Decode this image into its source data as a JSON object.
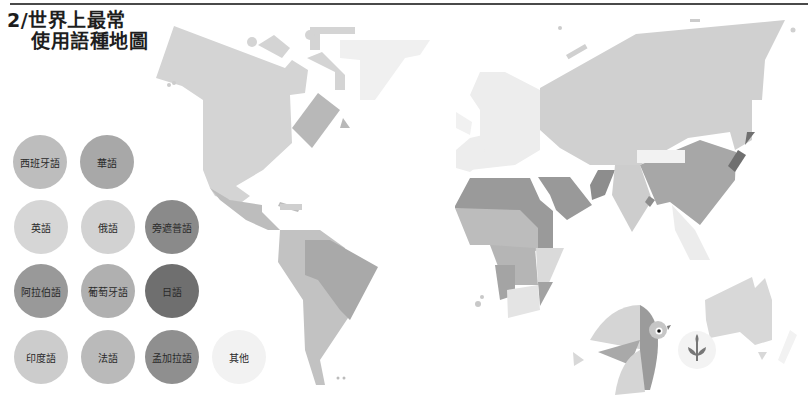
{
  "title": {
    "line1": "2/世界上最常",
    "line2": "使用語種地圖"
  },
  "legend": [
    {
      "label": "西班牙語",
      "color": "#bdbdbd"
    },
    {
      "label": "華語",
      "color": "#a8a8a8"
    },
    {
      "label": "英語",
      "color": "#d6d6d6"
    },
    {
      "label": "俄語",
      "color": "#d2d2d2"
    },
    {
      "label": "旁遮普語",
      "color": "#8a8a8a"
    },
    {
      "label": "阿拉伯語",
      "color": "#999999"
    },
    {
      "label": "葡萄牙語",
      "color": "#b0b0b0"
    },
    {
      "label": "日語",
      "color": "#6f6f6f"
    },
    {
      "label": "印度語",
      "color": "#cccccc"
    },
    {
      "label": "法語",
      "color": "#bababa"
    },
    {
      "label": "孟加拉語",
      "color": "#8f8f8f"
    },
    {
      "label": "其他",
      "color": "#f2f2f2"
    }
  ],
  "regions": [
    {
      "name": "north-america",
      "language": "英語",
      "color": "#d4d4d4"
    },
    {
      "name": "greenland",
      "language": "其他",
      "color": "#f0f0f0"
    },
    {
      "name": "quebec",
      "language": "法語",
      "color": "#b8b8b8"
    },
    {
      "name": "mexico-central-america",
      "language": "西班牙語",
      "color": "#bdbdbd"
    },
    {
      "name": "brazil",
      "language": "葡萄牙語",
      "color": "#a9a9a9"
    },
    {
      "name": "south-america-spanish",
      "language": "西班牙語",
      "color": "#c2c2c2"
    },
    {
      "name": "europe",
      "language": "其他",
      "color": "#ededed"
    },
    {
      "name": "russia",
      "language": "俄語",
      "color": "#d0d0d0"
    },
    {
      "name": "north-africa",
      "language": "阿拉伯語",
      "color": "#9a9a9a"
    },
    {
      "name": "middle-east",
      "language": "阿拉伯語",
      "color": "#999999"
    },
    {
      "name": "west-africa",
      "language": "法語",
      "color": "#bcbcbc"
    },
    {
      "name": "central-africa",
      "language": "法語",
      "color": "#b5b5b5"
    },
    {
      "name": "angola",
      "language": "葡萄牙語",
      "color": "#a4a4a4"
    },
    {
      "name": "east-africa",
      "language": "英語",
      "color": "#dadada"
    },
    {
      "name": "mozambique",
      "language": "葡萄牙語",
      "color": "#a2a2a2"
    },
    {
      "name": "south-africa",
      "language": "英語",
      "color": "#e4e4e4"
    },
    {
      "name": "pakistan",
      "language": "旁遮普語",
      "color": "#8d8d8d"
    },
    {
      "name": "india",
      "language": "印度語",
      "color": "#cdcdcd"
    },
    {
      "name": "bangladesh",
      "language": "孟加拉語",
      "color": "#8c8c8c"
    },
    {
      "name": "china",
      "language": "華語",
      "color": "#a7a7a7"
    },
    {
      "name": "japan",
      "language": "日語",
      "color": "#707070"
    },
    {
      "name": "southeast-asia",
      "language": "其他",
      "color": "#ececec"
    },
    {
      "name": "australia",
      "language": "英語",
      "color": "#d8d8d8"
    }
  ]
}
